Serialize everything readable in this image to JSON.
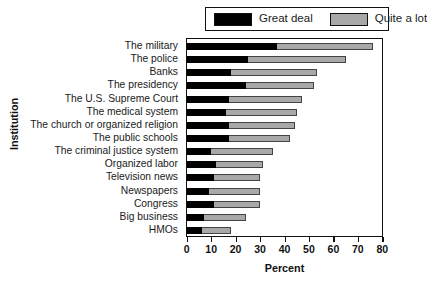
{
  "chart_data": {
    "type": "bar",
    "orientation": "horizontal",
    "stacked": true,
    "title": "",
    "xlabel": "Percent",
    "ylabel": "Institution",
    "xlim": [
      0,
      80
    ],
    "xticks": [
      0,
      10,
      20,
      30,
      40,
      50,
      60,
      70,
      80
    ],
    "grid": false,
    "legend_position": "top-right",
    "categories": [
      "The military",
      "The police",
      "Banks",
      "The presidency",
      "The U.S. Supreme Court",
      "The medical system",
      "The church or organized religion",
      "The public schools",
      "The criminal justice system",
      "Organized labor",
      "Television news",
      "Newspapers",
      "Congress",
      "Big business",
      "HMOs"
    ],
    "series": [
      {
        "name": "Great deal",
        "color": "#000000",
        "values": [
          37,
          25,
          18,
          24,
          17,
          16,
          17,
          17,
          10,
          12,
          11,
          9,
          11,
          7,
          6
        ]
      },
      {
        "name": "Quite a lot",
        "color": "#a8a8a8",
        "values": [
          39,
          40,
          35,
          28,
          30,
          29,
          27,
          25,
          25,
          19,
          19,
          21,
          19,
          17,
          12
        ]
      }
    ],
    "totals": [
      76,
      65,
      53,
      52,
      47,
      45,
      44,
      42,
      35,
      31,
      30,
      30,
      30,
      24,
      18
    ]
  },
  "legend": {
    "items": [
      {
        "label": "Great deal",
        "swatch": "black"
      },
      {
        "label": "Quite a lot",
        "swatch": "gray"
      }
    ]
  },
  "axes": {
    "x_title": "Percent",
    "y_title": "Institution",
    "x_tick_labels": [
      "0",
      "10",
      "20",
      "30",
      "40",
      "50",
      "60",
      "70",
      "80"
    ]
  }
}
